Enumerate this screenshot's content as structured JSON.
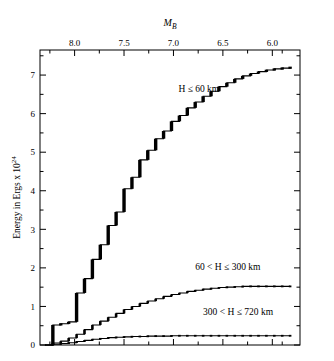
{
  "figure": {
    "top_axis_title": "M_B",
    "top_axis_title_main": "M",
    "top_axis_title_sub": "B",
    "y_axis_title_text": "Energy in Ergs x 10",
    "y_axis_title_exponent": "24",
    "background_color": "#ffffff",
    "line_color": "#000000"
  },
  "chart_data": {
    "type": "line",
    "title": "",
    "subtitle": "",
    "xlabel": "M_B",
    "ylabel": "Energy in Ergs x 10^24",
    "xlim": [
      8.35,
      5.72
    ],
    "ylim": [
      0,
      7.65
    ],
    "x_axis_inverted": true,
    "grid": false,
    "legend_position": "inline-annotations",
    "x_ticks": [
      8.0,
      7.5,
      7.0,
      6.5,
      6.0
    ],
    "x_tick_labels": [
      "8.0",
      "7.5",
      "7.0",
      "6.5",
      "6.0"
    ],
    "y_ticks": [
      0,
      1,
      2,
      3,
      4,
      5,
      6,
      7
    ],
    "y_tick_labels": [
      "0",
      "1",
      "2",
      "3",
      "4",
      "5",
      "6",
      "7"
    ],
    "x_minor_ticks": [
      8.25,
      7.75,
      7.25,
      6.75,
      6.25,
      5.9
    ],
    "annotations": [
      {
        "text": "H ≤ 60 km",
        "x": 6.95,
        "y": 6.55
      },
      {
        "text": "60 < H ≤ 300 km",
        "x": 6.78,
        "y": 1.95
      },
      {
        "text": "300 < H ≤ 720 km",
        "x": 6.7,
        "y": 0.78
      }
    ],
    "series": [
      {
        "name": "H ≤ 60 km",
        "label": "H ≤ 60 km",
        "style": "staircase",
        "x": [
          8.3,
          8.22,
          8.14,
          8.06,
          7.98,
          7.9,
          7.82,
          7.74,
          7.66,
          7.58,
          7.5,
          7.42,
          7.34,
          7.26,
          7.18,
          7.1,
          7.02,
          6.94,
          6.86,
          6.78,
          6.7,
          6.62,
          6.54,
          6.46,
          6.38,
          6.3,
          6.22,
          6.14,
          6.06,
          5.98,
          5.9,
          5.82
        ],
        "values": [
          0.0,
          0.52,
          0.55,
          0.6,
          1.35,
          1.72,
          2.22,
          2.6,
          3.1,
          3.45,
          4.05,
          4.35,
          4.8,
          5.05,
          5.35,
          5.55,
          5.8,
          5.95,
          6.15,
          6.3,
          6.45,
          6.58,
          6.7,
          6.8,
          6.9,
          6.98,
          7.04,
          7.09,
          7.13,
          7.16,
          7.18,
          7.2
        ]
      },
      {
        "name": "60 < H ≤ 300 km",
        "label": "60 < H ≤ 300 km",
        "style": "staircase",
        "x": [
          8.3,
          8.22,
          8.14,
          8.06,
          7.98,
          7.9,
          7.82,
          7.74,
          7.66,
          7.58,
          7.5,
          7.42,
          7.34,
          7.26,
          7.18,
          7.1,
          7.02,
          6.94,
          6.86,
          6.78,
          6.7,
          6.62,
          6.54,
          6.46,
          6.38,
          6.3,
          6.22,
          6.14,
          6.06,
          5.98,
          5.9,
          5.82
        ],
        "values": [
          0.0,
          0.05,
          0.1,
          0.18,
          0.28,
          0.4,
          0.52,
          0.62,
          0.72,
          0.82,
          0.92,
          1.0,
          1.08,
          1.14,
          1.2,
          1.26,
          1.31,
          1.35,
          1.39,
          1.42,
          1.45,
          1.47,
          1.49,
          1.5,
          1.51,
          1.52,
          1.52,
          1.52,
          1.52,
          1.52,
          1.52,
          1.52
        ]
      },
      {
        "name": "300 < H ≤ 720 km",
        "label": "300 < H ≤ 720 km",
        "style": "staircase",
        "x": [
          8.3,
          8.22,
          8.14,
          8.06,
          7.98,
          7.9,
          7.82,
          7.74,
          7.66,
          7.58,
          7.5,
          7.42,
          7.34,
          7.26,
          7.18,
          7.1,
          7.02,
          6.94,
          6.86,
          6.78,
          6.7,
          6.62,
          6.54,
          6.46,
          6.38,
          6.3,
          6.22,
          6.14,
          6.06,
          5.98,
          5.9,
          5.82
        ],
        "values": [
          0.0,
          0.02,
          0.04,
          0.06,
          0.09,
          0.12,
          0.15,
          0.17,
          0.19,
          0.2,
          0.21,
          0.22,
          0.22,
          0.23,
          0.23,
          0.23,
          0.24,
          0.24,
          0.24,
          0.24,
          0.24,
          0.24,
          0.24,
          0.24,
          0.24,
          0.24,
          0.24,
          0.24,
          0.24,
          0.24,
          0.24,
          0.24
        ]
      }
    ]
  }
}
